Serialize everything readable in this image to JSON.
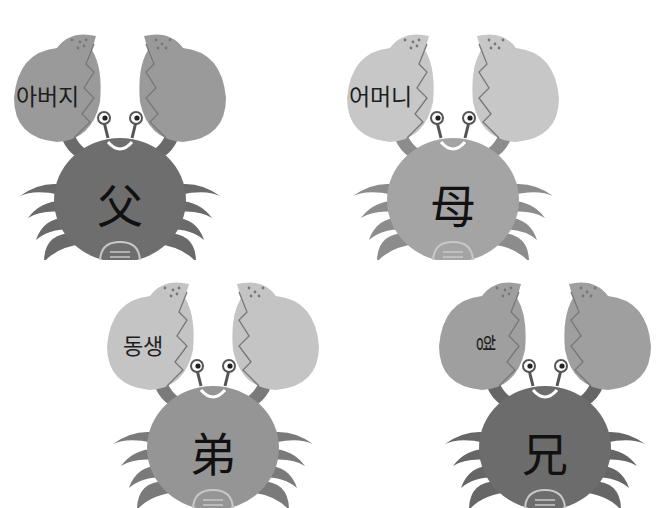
{
  "crabs": [
    {
      "korean": "아버지",
      "hanja": "父",
      "claw_color": "#9a9a9a",
      "body_color": "#6e6e6e",
      "leg_color": "#6a6a6a",
      "pos": {
        "x": 0,
        "y": 10
      }
    },
    {
      "korean": "어머니",
      "hanja": "母",
      "claw_color": "#c7c7c7",
      "body_color": "#a4a4a4",
      "leg_color": "#8c8c8c",
      "pos": {
        "x": 333,
        "y": 10
      }
    },
    {
      "korean": "동생",
      "hanja": "弟",
      "claw_color": "#c4c4c4",
      "body_color": "#959595",
      "leg_color": "#7a7a7a",
      "pos": {
        "x": 93,
        "y": 258
      }
    },
    {
      "korean": "형",
      "hanja": "兄",
      "claw_color": "#9f9f9f",
      "body_color": "#6c6c6c",
      "leg_color": "#666666",
      "pos": {
        "x": 425,
        "y": 258
      }
    }
  ]
}
